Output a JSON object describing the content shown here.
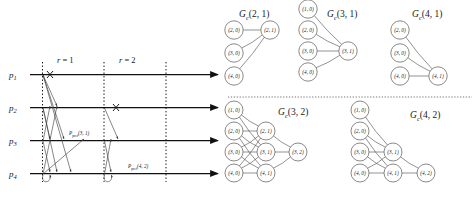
{
  "figure": {
    "colors": {
      "line": "#111111",
      "arrow": "#3b3b3b",
      "node_stroke": "#4a4a4a",
      "divider": "#555555",
      "background": "#ffffff"
    }
  },
  "timeline": {
    "processes": [
      {
        "id": "p1",
        "name": "p",
        "index": "1"
      },
      {
        "id": "p2",
        "name": "p",
        "index": "2"
      },
      {
        "id": "p3",
        "name": "p",
        "index": "3"
      },
      {
        "id": "p4",
        "name": "p",
        "index": "4"
      }
    ],
    "rounds": [
      {
        "id": "r1",
        "var": "r",
        "eq": " = 1"
      },
      {
        "id": "r2",
        "var": "r",
        "eq": " = 2"
      }
    ],
    "message_labels": [
      {
        "id": "pref31",
        "name": "P",
        "sub": "pref",
        "args": "(3, 1)"
      },
      {
        "id": "pref42",
        "name": "P",
        "sub": "pref",
        "args": "(4, 2)"
      }
    ],
    "crashes": [
      {
        "process": "p1",
        "round": "r1"
      },
      {
        "process": "p2",
        "round": "r2"
      }
    ]
  },
  "graphs": [
    {
      "id": "gc21",
      "name": "G",
      "sub": "c",
      "args": "(2, 1)",
      "nodes": [
        {
          "id": "n20",
          "label": "(2, 0)",
          "col": 0,
          "row": 0
        },
        {
          "id": "n30",
          "label": "(3, 0)",
          "col": 0,
          "row": 1
        },
        {
          "id": "n40",
          "label": "(4, 0)",
          "col": 0,
          "row": 2
        },
        {
          "id": "n21",
          "label": "(2, 1)",
          "col": 1,
          "row": 0
        }
      ],
      "edges": [
        [
          "n20",
          "n21"
        ],
        [
          "n30",
          "n21"
        ],
        [
          "n40",
          "n21"
        ]
      ]
    },
    {
      "id": "gc31",
      "name": "G",
      "sub": "c",
      "args": "(3, 1)",
      "nodes": [
        {
          "id": "n10",
          "label": "(1, 0)",
          "col": 0,
          "row": 0
        },
        {
          "id": "n20",
          "label": "(2, 0)",
          "col": 0,
          "row": 1
        },
        {
          "id": "n30",
          "label": "(3, 0)",
          "col": 0,
          "row": 2
        },
        {
          "id": "n40",
          "label": "(4, 0)",
          "col": 0,
          "row": 3
        },
        {
          "id": "n31",
          "label": "(3, 1)",
          "col": 1,
          "row": 2
        }
      ],
      "edges": [
        [
          "n10",
          "n31"
        ],
        [
          "n20",
          "n31"
        ],
        [
          "n30",
          "n31"
        ],
        [
          "n40",
          "n31"
        ]
      ]
    },
    {
      "id": "gc41",
      "name": "G",
      "sub": "c",
      "args": "(4, 1)",
      "nodes": [
        {
          "id": "n20",
          "label": "(2, 0)",
          "col": 0,
          "row": 0
        },
        {
          "id": "n30",
          "label": "(3, 0)",
          "col": 0,
          "row": 1
        },
        {
          "id": "n40",
          "label": "(4, 0)",
          "col": 0,
          "row": 2
        },
        {
          "id": "n41",
          "label": "(4, 1)",
          "col": 1,
          "row": 2
        }
      ],
      "edges": [
        [
          "n20",
          "n41"
        ],
        [
          "n30",
          "n41"
        ],
        [
          "n40",
          "n41"
        ]
      ]
    },
    {
      "id": "gc32",
      "name": "G",
      "sub": "c",
      "args": "(3, 2)",
      "nodes": [
        {
          "id": "n10",
          "label": "(1, 0)",
          "col": 0,
          "row": 0
        },
        {
          "id": "n20",
          "label": "(2, 0)",
          "col": 0,
          "row": 1
        },
        {
          "id": "n30",
          "label": "(3, 0)",
          "col": 0,
          "row": 2
        },
        {
          "id": "n40",
          "label": "(4, 0)",
          "col": 0,
          "row": 3
        },
        {
          "id": "n21",
          "label": "(2, 1)",
          "col": 1,
          "row": 1
        },
        {
          "id": "n31",
          "label": "(3, 1)",
          "col": 1,
          "row": 2
        },
        {
          "id": "n41",
          "label": "(4, 1)",
          "col": 1,
          "row": 3
        },
        {
          "id": "n32",
          "label": "(3, 2)",
          "col": 2,
          "row": 2
        }
      ],
      "edges": [
        [
          "n10",
          "n21"
        ],
        [
          "n10",
          "n31"
        ],
        [
          "n20",
          "n21"
        ],
        [
          "n20",
          "n31"
        ],
        [
          "n20",
          "n41"
        ],
        [
          "n30",
          "n21"
        ],
        [
          "n30",
          "n31"
        ],
        [
          "n30",
          "n41"
        ],
        [
          "n40",
          "n21"
        ],
        [
          "n40",
          "n31"
        ],
        [
          "n40",
          "n41"
        ],
        [
          "n21",
          "n32"
        ],
        [
          "n31",
          "n32"
        ],
        [
          "n41",
          "n32"
        ]
      ]
    },
    {
      "id": "gc42",
      "name": "G",
      "sub": "c",
      "args": "(4, 2)",
      "nodes": [
        {
          "id": "n10",
          "label": "(1, 0)",
          "col": 0,
          "row": 0
        },
        {
          "id": "n20",
          "label": "(2, 0)",
          "col": 0,
          "row": 1
        },
        {
          "id": "n30",
          "label": "(3, 0)",
          "col": 0,
          "row": 2
        },
        {
          "id": "n40",
          "label": "(4, 0)",
          "col": 0,
          "row": 3
        },
        {
          "id": "n31",
          "label": "(3, 1)",
          "col": 1,
          "row": 2
        },
        {
          "id": "n41",
          "label": "(4, 1)",
          "col": 1,
          "row": 3
        },
        {
          "id": "n42",
          "label": "(4, 2)",
          "col": 2,
          "row": 3
        }
      ],
      "edges": [
        [
          "n10",
          "n31"
        ],
        [
          "n20",
          "n31"
        ],
        [
          "n20",
          "n41"
        ],
        [
          "n30",
          "n31"
        ],
        [
          "n30",
          "n41"
        ],
        [
          "n40",
          "n31"
        ],
        [
          "n40",
          "n41"
        ],
        [
          "n31",
          "n42"
        ],
        [
          "n41",
          "n42"
        ]
      ]
    }
  ]
}
